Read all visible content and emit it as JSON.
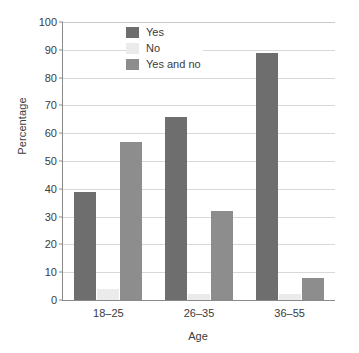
{
  "chart_data": {
    "type": "bar",
    "title": "",
    "xlabel": "Age",
    "ylabel": "Percentage",
    "categories": [
      "18–25",
      "26–35",
      "36–55"
    ],
    "series": [
      {
        "name": "Yes",
        "color": "#6e6e6e",
        "values": [
          39,
          66,
          89
        ]
      },
      {
        "name": "No",
        "color": "#ebebeb",
        "values": [
          4,
          2,
          2
        ]
      },
      {
        "name": "Yes and no",
        "color": "#8d8d8d",
        "values": [
          57,
          32,
          8
        ]
      }
    ],
    "ylim": [
      0,
      100
    ],
    "yticks": [
      0,
      10,
      20,
      30,
      40,
      50,
      60,
      70,
      80,
      90,
      100
    ],
    "ytick_labels": [
      "0",
      "10",
      "20",
      "30",
      "40",
      "50",
      "60",
      "70",
      "80",
      "90",
      "100"
    ],
    "grid": true,
    "grid_axis": "y",
    "legend_position": "top-left-inside",
    "legend_entries": [
      "Yes",
      "No",
      "Yes and no"
    ],
    "bar_group_mode": "grouped"
  },
  "axes": {
    "y_title": "Percentage",
    "x_title": "Age"
  }
}
